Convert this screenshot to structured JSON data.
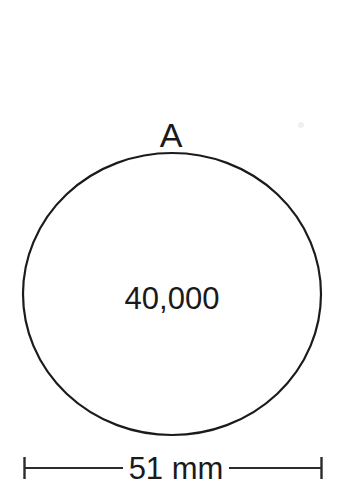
{
  "figure": {
    "background_color": "#ffffff",
    "line_color": "#1b1b1b",
    "text_color": "#1a1a1a"
  },
  "shape": {
    "type": "circle",
    "label": "A",
    "value_label": "40,000",
    "center_x": 172,
    "center_y": 294,
    "radius_x": 149,
    "radius_y": 141
  },
  "dimension": {
    "label": "51 mm",
    "value": 51,
    "unit": "mm",
    "line_y": 468,
    "left_tick_x": 24,
    "right_tick_x": 322,
    "tick_half_height": 11
  }
}
